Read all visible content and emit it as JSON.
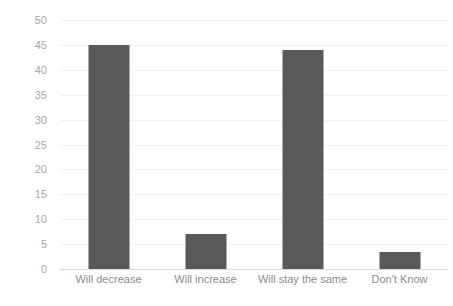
{
  "chart_data": {
    "type": "bar",
    "title": "",
    "subtitle": "",
    "xlabel": "",
    "ylabel": "",
    "categories": [
      "Will decrease",
      "Will increase",
      "Will stay the same",
      "Don't Know"
    ],
    "values": [
      45,
      7,
      44,
      3.5
    ],
    "series": [
      {
        "name": "Responses",
        "values": [
          45,
          7,
          44,
          3.5
        ]
      }
    ],
    "ylim": [
      0,
      50
    ],
    "ytick_step": 5,
    "ytick_labels": [
      "0",
      "5",
      "10",
      "15",
      "20",
      "25",
      "30",
      "35",
      "40",
      "45",
      "50"
    ],
    "grid": true,
    "grid_axis": "y",
    "legend": false,
    "legend_position": "none",
    "bar_color": "#595959",
    "gridline_color": "#f2f2f2",
    "axis_line_color": "#d9d9d9",
    "tick_label_color": "#a6a6a6",
    "category_label_color": "#8c8c8c",
    "background_color": "#ffffff"
  }
}
